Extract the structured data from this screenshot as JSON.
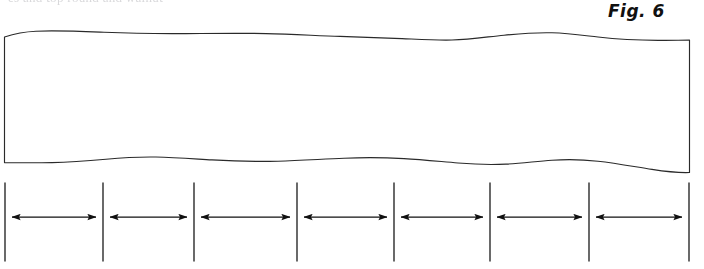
{
  "page": {
    "width": 704,
    "height": 269,
    "background_color": "#ffffff",
    "ink_color": "#1a1a1a"
  },
  "cropped_text_line": {
    "text": "es and top round and walnut",
    "note": "faint partial line of body text clipped at the top edge of the crop",
    "color": "#b9b9bd"
  },
  "caption": {
    "label": "Fig. 6",
    "style": "italic",
    "color": "#101010"
  },
  "figure": {
    "type": "technical-line-drawing",
    "band": {
      "left_x": 4,
      "right_x": 690,
      "top_edge_y_range": [
        30,
        45
      ],
      "bottom_edge_y_range": [
        155,
        174
      ],
      "edge_style": "freehand-wavy",
      "stroke_color": "#2a2a2a",
      "stroke_width": 1.1,
      "fill": "#ffffff"
    },
    "scale": {
      "tick_count": 8,
      "tick_top_y": 183,
      "tick_bottom_y": 261,
      "tick_positions_x": [
        5,
        103,
        194,
        297,
        394,
        490,
        589,
        689
      ],
      "tick_stroke_color": "#2a2a2a",
      "tick_stroke_width": 1.4,
      "arrow_axis_y": 217,
      "arrow_color": "#111111",
      "arrow_count": 7,
      "arrow_segments": [
        {
          "index": 1,
          "from_x": 5,
          "to_x": 103,
          "span_px": 98
        },
        {
          "index": 2,
          "from_x": 103,
          "to_x": 194,
          "span_px": 91
        },
        {
          "index": 3,
          "from_x": 194,
          "to_x": 297,
          "span_px": 103
        },
        {
          "index": 4,
          "from_x": 297,
          "to_x": 394,
          "span_px": 97
        },
        {
          "index": 5,
          "from_x": 394,
          "to_x": 490,
          "span_px": 96
        },
        {
          "index": 6,
          "from_x": 490,
          "to_x": 589,
          "span_px": 99
        },
        {
          "index": 7,
          "from_x": 589,
          "to_x": 689,
          "span_px": 100
        }
      ]
    }
  }
}
